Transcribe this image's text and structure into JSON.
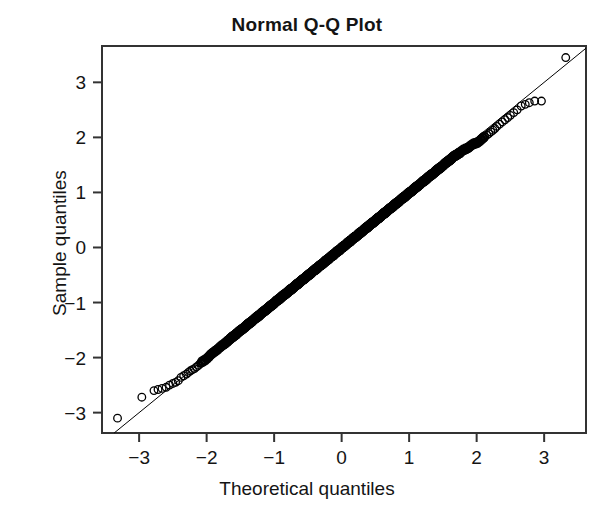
{
  "chart_data": {
    "type": "scatter",
    "title": "Normal Q-Q Plot",
    "xlabel": "Theoretical quantiles",
    "ylabel": "Sample quantiles",
    "xlim": [
      -3.55,
      3.62
    ],
    "ylim": [
      -3.37,
      3.66
    ],
    "xticks": [
      -3,
      -2,
      -1,
      0,
      1,
      2,
      3
    ],
    "xticklabels": [
      "−3",
      "−2",
      "−1",
      "0",
      "1",
      "2",
      "3"
    ],
    "yticks": [
      3,
      2,
      1,
      0,
      -1,
      -2,
      -3
    ],
    "yticklabels": [
      "3",
      "2",
      "1",
      "0",
      "−1",
      "−2",
      "−3"
    ],
    "grid": false,
    "legend": null,
    "marker": "open-circle",
    "marker_color": "#000000",
    "marker_size_px": 5,
    "reference_line": {
      "name": "qqline",
      "slope": 1.0,
      "intercept": 0.0,
      "color": "#000000",
      "width_px": 1
    },
    "n_points": 620,
    "series": [
      {
        "name": "sample quantiles vs theoretical quantiles",
        "x": [
          -3.32,
          -2.96,
          -2.78,
          -2.72,
          -2.66,
          -2.6,
          -2.55,
          -2.5,
          -2.46,
          -2.42,
          -2.38,
          -2.34,
          -2.3,
          -2.27,
          -2.24,
          -2.21,
          -2.18,
          -2.15,
          -2.12,
          -2.09,
          -2.06,
          -2.03,
          -2.0,
          -1.97,
          -1.94,
          -1.91,
          -1.88,
          -1.85,
          -1.82,
          -1.79,
          -1.76,
          -1.73,
          -1.7,
          -1.67,
          -1.64,
          -1.62,
          -1.6,
          -1.57,
          -1.55,
          -1.52,
          -1.5,
          -1.47,
          -1.45,
          -1.42,
          -1.4,
          -1.38,
          -1.35,
          -1.33,
          -1.31,
          -1.28,
          -1.26,
          -1.24,
          -1.22,
          -1.2,
          -1.18,
          -1.15,
          -1.13,
          -1.11,
          -1.09,
          -1.07,
          -1.05,
          -1.03,
          -1.01,
          -0.99,
          -0.97,
          -0.95,
          -0.93,
          -0.91,
          -0.89,
          -0.87,
          -0.85,
          -0.83,
          -0.81,
          -0.79,
          -0.77,
          -0.76,
          -0.74,
          -0.72,
          -0.7,
          -0.68,
          -0.66,
          -0.64,
          -0.63,
          -0.61,
          -0.59,
          -0.57,
          -0.55,
          -0.54,
          -0.52,
          -0.5,
          -0.48,
          -0.46,
          -0.45,
          -0.43,
          -0.41,
          -0.39,
          -0.38,
          -0.36,
          -0.34,
          -0.32,
          -0.31,
          -0.29,
          -0.27,
          -0.25,
          -0.24,
          -0.22,
          -0.2,
          -0.19,
          -0.17,
          -0.15,
          -0.13,
          -0.12,
          -0.1,
          -0.08,
          -0.07,
          -0.05,
          -0.03,
          -0.02,
          0.0,
          0.02,
          0.03,
          0.05,
          0.07,
          0.08,
          0.1,
          0.12,
          0.13,
          0.15,
          0.17,
          0.19,
          0.2,
          0.22,
          0.24,
          0.25,
          0.27,
          0.29,
          0.31,
          0.32,
          0.34,
          0.36,
          0.38,
          0.39,
          0.41,
          0.43,
          0.45,
          0.46,
          0.48,
          0.5,
          0.52,
          0.54,
          0.55,
          0.57,
          0.59,
          0.61,
          0.63,
          0.64,
          0.66,
          0.68,
          0.7,
          0.72,
          0.74,
          0.76,
          0.77,
          0.79,
          0.81,
          0.83,
          0.85,
          0.87,
          0.89,
          0.91,
          0.93,
          0.95,
          0.97,
          0.99,
          1.01,
          1.03,
          1.05,
          1.07,
          1.09,
          1.11,
          1.13,
          1.15,
          1.18,
          1.2,
          1.22,
          1.24,
          1.26,
          1.28,
          1.31,
          1.33,
          1.35,
          1.38,
          1.4,
          1.42,
          1.45,
          1.47,
          1.5,
          1.52,
          1.55,
          1.57,
          1.6,
          1.62,
          1.64,
          1.67,
          1.7,
          1.73,
          1.76,
          1.79,
          1.82,
          1.85,
          1.88,
          1.91,
          1.94,
          1.97,
          2.0,
          2.03,
          2.06,
          2.09,
          2.12,
          2.15,
          2.18,
          2.21,
          2.24,
          2.27,
          2.3,
          2.34,
          2.38,
          2.42,
          2.46,
          2.5,
          2.55,
          2.6,
          2.66,
          2.72,
          2.78,
          2.86,
          2.96,
          3.32
        ],
        "y": [
          -3.1,
          -2.72,
          -2.6,
          -2.58,
          -2.56,
          -2.54,
          -2.5,
          -2.47,
          -2.45,
          -2.42,
          -2.36,
          -2.33,
          -2.3,
          -2.27,
          -2.24,
          -2.22,
          -2.2,
          -2.17,
          -2.14,
          -2.1,
          -2.07,
          -2.05,
          -2.02,
          -1.99,
          -1.95,
          -1.92,
          -1.89,
          -1.86,
          -1.83,
          -1.8,
          -1.77,
          -1.74,
          -1.71,
          -1.68,
          -1.65,
          -1.63,
          -1.61,
          -1.58,
          -1.56,
          -1.53,
          -1.51,
          -1.48,
          -1.46,
          -1.43,
          -1.41,
          -1.39,
          -1.36,
          -1.34,
          -1.32,
          -1.29,
          -1.27,
          -1.25,
          -1.23,
          -1.21,
          -1.19,
          -1.16,
          -1.14,
          -1.12,
          -1.1,
          -1.08,
          -1.06,
          -1.04,
          -1.02,
          -1.0,
          -0.98,
          -0.96,
          -0.94,
          -0.92,
          -0.9,
          -0.88,
          -0.86,
          -0.84,
          -0.82,
          -0.8,
          -0.78,
          -0.77,
          -0.75,
          -0.73,
          -0.71,
          -0.69,
          -0.67,
          -0.65,
          -0.64,
          -0.62,
          -0.6,
          -0.58,
          -0.56,
          -0.55,
          -0.53,
          -0.51,
          -0.49,
          -0.47,
          -0.46,
          -0.44,
          -0.42,
          -0.4,
          -0.39,
          -0.37,
          -0.35,
          -0.33,
          -0.32,
          -0.3,
          -0.28,
          -0.26,
          -0.25,
          -0.23,
          -0.21,
          -0.2,
          -0.18,
          -0.16,
          -0.14,
          -0.13,
          -0.11,
          -0.09,
          -0.08,
          -0.06,
          -0.04,
          -0.03,
          -0.01,
          0.01,
          0.02,
          0.04,
          0.06,
          0.07,
          0.09,
          0.11,
          0.12,
          0.14,
          0.16,
          0.18,
          0.19,
          0.21,
          0.23,
          0.24,
          0.26,
          0.28,
          0.3,
          0.31,
          0.33,
          0.35,
          0.37,
          0.38,
          0.4,
          0.42,
          0.44,
          0.45,
          0.47,
          0.49,
          0.51,
          0.53,
          0.54,
          0.56,
          0.58,
          0.6,
          0.62,
          0.63,
          0.65,
          0.67,
          0.69,
          0.71,
          0.73,
          0.75,
          0.76,
          0.78,
          0.8,
          0.82,
          0.84,
          0.86,
          0.88,
          0.9,
          0.92,
          0.94,
          0.96,
          0.98,
          1.0,
          1.02,
          1.04,
          1.06,
          1.08,
          1.1,
          1.12,
          1.14,
          1.17,
          1.19,
          1.21,
          1.23,
          1.25,
          1.27,
          1.3,
          1.32,
          1.34,
          1.37,
          1.39,
          1.41,
          1.44,
          1.46,
          1.49,
          1.51,
          1.54,
          1.56,
          1.59,
          1.61,
          1.63,
          1.66,
          1.68,
          1.71,
          1.73,
          1.76,
          1.78,
          1.8,
          1.82,
          1.85,
          1.87,
          1.89,
          1.9,
          1.92,
          1.95,
          1.98,
          2.01,
          2.04,
          2.07,
          2.1,
          2.13,
          2.16,
          2.2,
          2.24,
          2.28,
          2.32,
          2.36,
          2.4,
          2.45,
          2.5,
          2.57,
          2.6,
          2.63,
          2.66,
          2.66,
          3.45
        ]
      }
    ]
  },
  "style": {
    "background": "#ffffff",
    "axis_color": "#333333",
    "text_color": "#141414"
  }
}
